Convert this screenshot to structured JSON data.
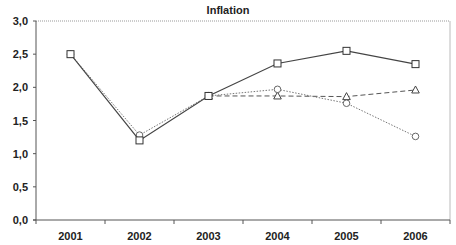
{
  "chart_data": {
    "type": "line",
    "title": "Inflation",
    "xlabel": "",
    "ylabel": "",
    "categories": [
      "2001",
      "2002",
      "2003",
      "2004",
      "2005",
      "2006"
    ],
    "ylim": [
      0,
      3.0
    ],
    "yticks": [
      "0,0",
      "0,5",
      "1,0",
      "1,5",
      "2,0",
      "2,5",
      "3,0"
    ],
    "ytick_values": [
      0,
      0.5,
      1.0,
      1.5,
      2.0,
      2.5,
      3.0
    ],
    "grid": false,
    "legend": "none",
    "series": [
      {
        "name": "Series square (solid)",
        "marker": "square",
        "line": "solid",
        "color": "#444444",
        "values": [
          2.5,
          1.2,
          1.87,
          2.36,
          2.55,
          2.35
        ]
      },
      {
        "name": "Series circle (dotted)",
        "marker": "circle",
        "line": "dotted",
        "color": "#777777",
        "values": [
          2.5,
          1.28,
          1.87,
          1.97,
          1.76,
          1.26
        ]
      },
      {
        "name": "Series triangle (dashed)",
        "marker": "triangle",
        "line": "dashed",
        "color": "#555555",
        "values": [
          null,
          null,
          1.87,
          1.87,
          1.86,
          1.96
        ]
      }
    ]
  }
}
